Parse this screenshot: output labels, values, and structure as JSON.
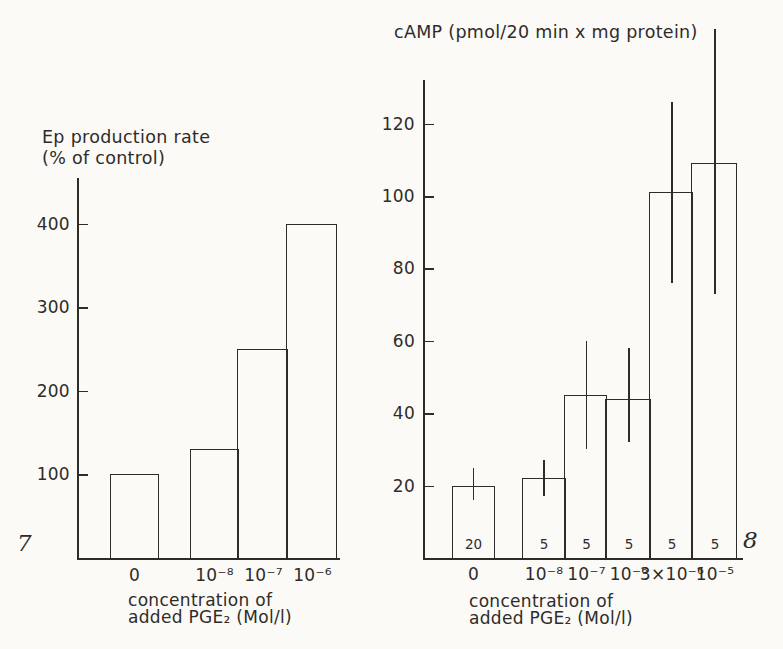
{
  "colors": {
    "ink": "#2e2c29",
    "paper": "#fbfaf7"
  },
  "chart_data": [
    {
      "type": "bar",
      "fig_number": "7",
      "title": "Ep production rate (% of control)",
      "title_lines": [
        "Ep production rate",
        "(% of control)"
      ],
      "xlabel": "concentration of added PGE₂ (Mol/l)",
      "xlabel_lines": [
        "concentration of",
        "added PGE₂ (Mol/l)"
      ],
      "ylabel": "Ep production rate (% of control)",
      "categories": [
        "0",
        "10⁻⁸",
        "10⁻⁷",
        "10⁻⁶"
      ],
      "values": [
        100,
        130,
        250,
        400
      ],
      "yticks": [
        100,
        200,
        300,
        400
      ],
      "ylim": [
        0,
        455
      ],
      "grid": false,
      "legend": false
    },
    {
      "type": "bar",
      "fig_number": "8",
      "title": "cAMP (pmol/20 min x mg protein)",
      "title_lines": [
        "cAMP (pmol/20 min x mg protein)"
      ],
      "xlabel": "concentration of added PGE₂ (Mol/l)",
      "xlabel_lines": [
        "concentration of",
        "added PGE₂ (Mol/l)"
      ],
      "ylabel": "cAMP (pmol/20 min x mg protein)",
      "categories": [
        "0",
        "10⁻⁸",
        "10⁻⁷",
        "10⁻⁶",
        "3×10⁻⁶",
        "10⁻⁵"
      ],
      "values": [
        20,
        22,
        45,
        44,
        101,
        109
      ],
      "error_low": [
        16,
        17,
        30,
        32,
        76,
        73
      ],
      "error_high": [
        25,
        27,
        60,
        58,
        126,
        146
      ],
      "n_labels": [
        "20",
        "5",
        "5",
        "5",
        "5",
        "5"
      ],
      "yticks": [
        20,
        40,
        60,
        80,
        100,
        120
      ],
      "ylim": [
        0,
        132
      ],
      "grid": false,
      "legend": false
    }
  ]
}
